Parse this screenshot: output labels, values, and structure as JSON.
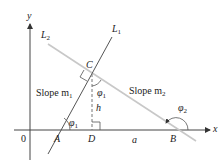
{
  "diagram": {
    "axes": {
      "x_label": "x",
      "y_label": "y",
      "origin_label": "0"
    },
    "lines": [
      {
        "id": "L1",
        "label": "L",
        "subscript": "1",
        "slope_label": "Slope m",
        "slope_sub": "1"
      },
      {
        "id": "L2",
        "label": "L",
        "subscript": "2",
        "slope_label": "Slope m",
        "slope_sub": "2"
      }
    ],
    "points": {
      "A": "A",
      "B": "B",
      "C": "C",
      "D": "D"
    },
    "segments": {
      "h": "h",
      "a": "a"
    },
    "angles": {
      "phi1_at_A": "φ",
      "phi1_sub": "1",
      "phi1_at_C": "φ",
      "phi2_at_B": "φ",
      "phi2_sub": "2"
    },
    "colors": {
      "axis": "#333333",
      "L1": "#555555",
      "L2": "#c8c8c8",
      "dashed": "#777777"
    }
  }
}
